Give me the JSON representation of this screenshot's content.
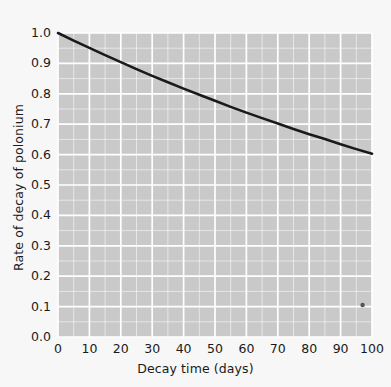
{
  "chart_data": {
    "type": "line",
    "title": "",
    "xlabel": "Decay time (days)",
    "ylabel": "Rate of decay of polonium",
    "xlim": [
      0,
      100
    ],
    "ylim": [
      0.0,
      1.0
    ],
    "xticks": [
      "0",
      "10",
      "20",
      "30",
      "40",
      "50",
      "60",
      "70",
      "80",
      "90",
      "100"
    ],
    "xtick_values": [
      0,
      10,
      20,
      30,
      40,
      50,
      60,
      70,
      80,
      90,
      100
    ],
    "yticks": [
      "0.0",
      "0.1",
      "0.2",
      "0.3",
      "0.4",
      "0.5",
      "0.6",
      "0.7",
      "0.8",
      "0.9",
      "1.0"
    ],
    "ytick_values": [
      0.0,
      0.1,
      0.2,
      0.3,
      0.4,
      0.5,
      0.6,
      0.7,
      0.8,
      0.9,
      1.0
    ],
    "grid": true,
    "grid_minor": true,
    "legend": "none",
    "series": [
      {
        "name": "Rate of decay of polonium",
        "type": "line",
        "color": "#1a1a1a",
        "linewidth": 2.6,
        "x": [
          0,
          5,
          10,
          15,
          20,
          25,
          30,
          35,
          40,
          45,
          50,
          55,
          60,
          65,
          70,
          75,
          80,
          85,
          90,
          95,
          100
        ],
        "y": [
          1.0,
          0.975,
          0.951,
          0.927,
          0.904,
          0.881,
          0.859,
          0.838,
          0.817,
          0.797,
          0.777,
          0.757,
          0.738,
          0.72,
          0.702,
          0.684,
          0.667,
          0.651,
          0.634,
          0.618,
          0.603
        ]
      },
      {
        "name": "isolated marker",
        "type": "scatter",
        "color": "#555555",
        "markersize": 4,
        "x": [
          97
        ],
        "y": [
          0.105
        ]
      }
    ],
    "plot_bg_color": "#c9c9c9",
    "figure_bg_color": "#f7f7f7",
    "grid_color": "#ffffff"
  }
}
